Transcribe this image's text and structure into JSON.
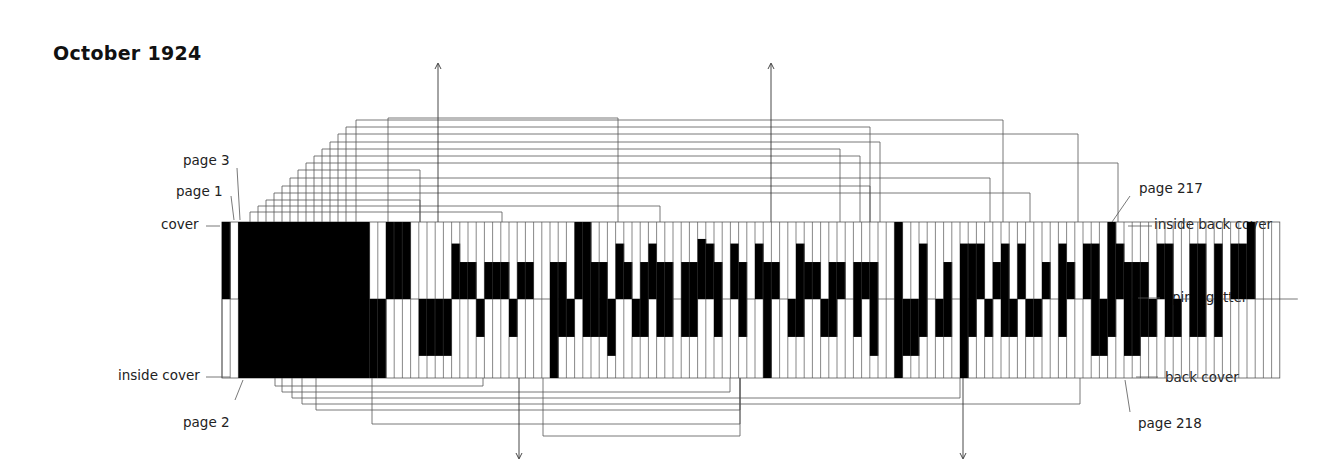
{
  "title": "October 1924",
  "labels": {
    "page3": "page 3",
    "page1": "page 1",
    "cover": "cover",
    "inside_cover": "inside cover",
    "page2": "page 2",
    "page217": "page 217",
    "inside_back_cover": "inside back cover",
    "spine_gutter": "spine/gutter",
    "back_cover": "back cover",
    "page218": "page 218"
  },
  "colors": {
    "ink": "#000000",
    "line": "#555555",
    "paper": "#ffffff"
  },
  "geometry": {
    "x0": 222,
    "pitch": 8.2,
    "top": 222,
    "spine": 299,
    "bottom": 378
  },
  "chart_data": {
    "type": "diagram",
    "title": "October 1924",
    "top_fill": [
      1,
      0,
      1,
      1,
      1,
      1,
      1,
      1,
      1,
      1,
      1,
      1,
      1,
      1,
      1,
      1,
      1,
      1,
      0,
      0,
      1,
      1,
      1,
      0,
      0,
      0,
      0,
      0,
      0.72,
      0.48,
      0.48,
      0,
      0.48,
      0.48,
      0.48,
      0,
      0.48,
      0.48,
      0,
      0,
      0.48,
      0.48,
      0,
      1,
      1,
      0.48,
      0.48,
      0,
      0.72,
      0.48,
      0,
      0.48,
      0.72,
      0.48,
      0.48,
      0,
      0.48,
      0.48,
      0.78,
      0.72,
      0.48,
      0,
      0.72,
      0.48,
      0,
      0.72,
      0.48,
      0.48,
      0,
      0,
      0.72,
      0.48,
      0.48,
      0,
      0.48,
      0.48,
      0,
      0.48,
      0.48,
      0.48,
      0,
      0,
      1,
      0,
      0,
      0.72,
      0,
      0,
      0.48,
      0,
      0.72,
      0.72,
      0.72,
      0,
      0.48,
      0.72,
      0,
      0.72,
      0,
      0,
      0.48,
      0,
      0.72,
      0.48,
      0,
      0.72,
      0.72,
      0,
      1,
      0.72,
      0.48,
      0.48,
      0.48,
      0,
      0.72,
      0.72,
      0,
      0,
      0.72,
      0.72,
      0,
      0.72,
      0,
      0.72,
      0.72,
      1,
      0,
      0,
      0
    ],
    "bottom_fill": [
      0,
      0,
      0,
      1,
      1,
      1,
      1,
      1,
      1,
      1,
      1,
      1,
      1,
      1,
      1,
      1,
      1,
      1,
      1,
      1,
      0,
      0,
      0,
      0,
      0.72,
      0.72,
      0.72,
      0.72,
      0,
      0,
      0,
      0.48,
      0,
      0,
      0,
      0.48,
      0,
      0,
      0,
      0,
      1,
      0.48,
      0.48,
      0,
      0.48,
      0.48,
      0.48,
      0.72,
      0,
      0,
      0.48,
      0.48,
      0,
      0.48,
      0.48,
      0,
      0.48,
      0.48,
      0,
      0,
      0.48,
      0,
      0,
      0.48,
      0,
      0,
      1,
      0,
      0,
      0.48,
      0.48,
      0,
      0,
      0.48,
      0.48,
      0,
      0,
      0.48,
      0,
      0.72,
      0,
      0,
      1,
      0.72,
      0.72,
      0.48,
      0,
      0.48,
      0.48,
      0,
      1,
      0.48,
      0,
      0.48,
      0,
      0.48,
      0.48,
      0,
      0.48,
      0.48,
      0,
      0,
      0.48,
      0,
      0,
      0,
      0.72,
      0.72,
      0.48,
      0,
      0.72,
      0.72,
      0.48,
      0.48,
      0,
      0.48,
      0.48,
      0,
      0.48,
      0.48,
      0,
      0.48,
      0,
      0,
      0,
      0
    ],
    "arrows": [
      {
        "direction": "up",
        "x": 438
      },
      {
        "direction": "up",
        "x": 771
      },
      {
        "direction": "down",
        "x": 519
      },
      {
        "direction": "down",
        "x": 963
      }
    ]
  }
}
